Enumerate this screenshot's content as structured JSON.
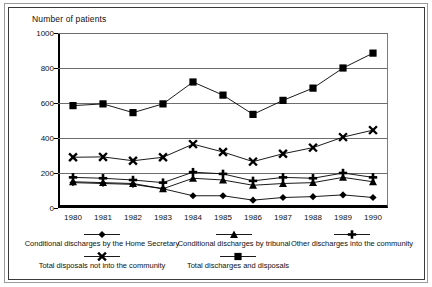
{
  "chart_data": {
    "type": "line",
    "title": "Number of patients",
    "xlabel": "",
    "ylabel": "Number of patients",
    "grid": true,
    "legend_position": "bottom",
    "ylim": [
      0,
      1000
    ],
    "yticks": [
      "0",
      "200",
      "400",
      "600",
      "800",
      "1000"
    ],
    "categories": [
      "1980",
      "1981",
      "1982",
      "1983",
      "1984",
      "1985",
      "1986",
      "1987",
      "1988",
      "1989",
      "1990"
    ],
    "series": [
      {
        "name": "Total discharges and disposals",
        "marker": "square",
        "values": [
          585,
          595,
          545,
          595,
          720,
          645,
          535,
          615,
          685,
          800,
          885
        ]
      },
      {
        "name": "Total disposals not into the community",
        "marker": "cross-x",
        "values": [
          290,
          292,
          270,
          290,
          365,
          320,
          265,
          310,
          345,
          405,
          445
        ]
      },
      {
        "name": "Other discharges into the community",
        "marker": "plus",
        "values": [
          175,
          170,
          160,
          145,
          205,
          195,
          155,
          175,
          170,
          200,
          175
        ]
      },
      {
        "name": "Conditional discharges by tribunal",
        "marker": "triangle",
        "values": [
          150,
          145,
          140,
          110,
          170,
          160,
          130,
          140,
          145,
          175,
          150
        ]
      },
      {
        "name": "Conditional discharges by the Home Secretary",
        "marker": "diamond",
        "values": [
          145,
          140,
          135,
          110,
          70,
          70,
          45,
          60,
          65,
          75,
          60
        ]
      }
    ]
  },
  "legend": {
    "row1": [
      {
        "label": "Conditional discharges by the Home Secretary",
        "marker": "diamond"
      },
      {
        "label": "Conditional discharges by tribunal",
        "marker": "triangle"
      },
      {
        "label": "Other discharges into the community",
        "marker": "plus"
      }
    ],
    "row2": [
      {
        "label": "Total disposals not into the community",
        "marker": "cross-x"
      },
      {
        "label": "Total discharges and disposals",
        "marker": "square"
      }
    ]
  },
  "colors": {
    "series": "#000000",
    "grid": "#6d6d6d",
    "axis": "#000000",
    "background": "#ffffff"
  }
}
